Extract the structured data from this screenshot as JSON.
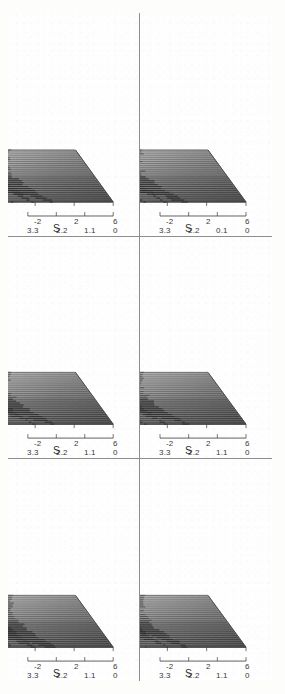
{
  "figure": {
    "caption_tags": [
      "(a)",
      "(b)",
      "(c)",
      "(d)",
      "(e)",
      "(f)"
    ],
    "orientation": "rotated-90-ccw",
    "panel_count": 6,
    "frame_color": "#8d8d8d",
    "ink_color": "#303030",
    "paper_color": "#fdfdfc"
  },
  "axes": {
    "p_name": "P",
    "s_name": "S",
    "x_name": "X",
    "p_ticks": [
      "3.3",
      "2.2",
      "1.1",
      "0"
    ],
    "p_ticks_alt": [
      "3.3",
      "2.2",
      "0.1",
      "0"
    ],
    "s_ticks": [
      "6",
      "2",
      "-2",
      "-6"
    ],
    "x_ticks": [
      "0.9",
      "0.3",
      "-0.3",
      "-0.9"
    ],
    "origin_tick": "6"
  },
  "chart_data": {
    "type": "line",
    "title": "",
    "subtitle": "",
    "xlabel": "S",
    "ylabel": "P",
    "zlabel": "X",
    "grid": false,
    "legend": "none",
    "projection": "3d-waterfall-mesh",
    "xlim": [
      -6,
      6
    ],
    "ylim": [
      0,
      3.3
    ],
    "zlim": [
      -0.9,
      0.9
    ],
    "x": [
      -6,
      -5.5,
      -5,
      -4.5,
      -4,
      -3.5,
      -3,
      -2.5,
      -2,
      -1.5,
      -1,
      -0.5,
      0,
      0.5,
      1,
      1.5,
      2,
      2.5,
      3,
      3.5,
      4,
      4.5,
      5,
      5.5,
      6
    ],
    "traces_per_panel": 28,
    "panels": [
      {
        "tag": "(a)",
        "row": 1,
        "col": 1,
        "p_ticks": [
          "3.3",
          "2.2",
          "1.1",
          "0"
        ],
        "peak_max": 3.3,
        "peak_positions": [
          -1.6,
          -0.4,
          0.9,
          2.3,
          3.6
        ],
        "series": [
          {
            "name": "X=0.9",
            "values": [
              0.02,
              0.04,
              0.07,
              0.12,
              0.22,
              0.45,
              0.9,
              1.6,
              2.4,
              1.4,
              0.7,
              0.5,
              0.85,
              1.5,
              0.9,
              0.45,
              0.3,
              0.55,
              1.1,
              0.6,
              0.3,
              0.18,
              0.1,
              0.05,
              0.02
            ]
          },
          {
            "name": "X=0.3",
            "values": [
              0.03,
              0.05,
              0.09,
              0.16,
              0.3,
              0.62,
              1.25,
              2.2,
              3.3,
              1.9,
              0.95,
              0.62,
              1.1,
              1.95,
              1.15,
              0.6,
              0.4,
              0.72,
              1.4,
              0.78,
              0.4,
              0.22,
              0.12,
              0.06,
              0.02
            ]
          },
          {
            "name": "X=-0.3",
            "values": [
              0.02,
              0.04,
              0.08,
              0.14,
              0.26,
              0.52,
              1.05,
              1.85,
              2.7,
              1.6,
              0.8,
              0.55,
              0.95,
              1.7,
              1.0,
              0.5,
              0.34,
              0.62,
              1.2,
              0.66,
              0.34,
              0.2,
              0.11,
              0.05,
              0.02
            ]
          },
          {
            "name": "X=-0.9",
            "values": [
              0.01,
              0.03,
              0.05,
              0.09,
              0.17,
              0.34,
              0.7,
              1.2,
              1.8,
              1.05,
              0.55,
              0.38,
              0.65,
              1.15,
              0.68,
              0.35,
              0.23,
              0.42,
              0.82,
              0.45,
              0.23,
              0.13,
              0.07,
              0.03,
              0.01
            ]
          }
        ]
      },
      {
        "tag": "(b)",
        "row": 1,
        "col": 2,
        "p_ticks": [
          "3.3",
          "2.2",
          "1.1",
          "0"
        ],
        "peak_max": 2.8,
        "peak_positions": [
          -1.9,
          -0.6,
          0.7,
          2.1,
          3.4
        ],
        "series": [
          {
            "name": "X=0.9",
            "values": [
              0.02,
              0.04,
              0.08,
              0.14,
              0.26,
              0.5,
              0.95,
              1.5,
              2.1,
              1.5,
              0.85,
              0.6,
              0.95,
              1.45,
              1.0,
              0.55,
              0.38,
              0.6,
              1.05,
              0.65,
              0.35,
              0.2,
              0.11,
              0.05,
              0.02
            ]
          },
          {
            "name": "X=0.3",
            "values": [
              0.03,
              0.06,
              0.11,
              0.19,
              0.34,
              0.66,
              1.3,
              2.05,
              2.8,
              2.0,
              1.15,
              0.8,
              1.3,
              1.95,
              1.35,
              0.72,
              0.5,
              0.8,
              1.4,
              0.85,
              0.46,
              0.26,
              0.14,
              0.07,
              0.03
            ]
          },
          {
            "name": "X=-0.3",
            "values": [
              0.02,
              0.05,
              0.09,
              0.16,
              0.29,
              0.56,
              1.1,
              1.72,
              2.35,
              1.68,
              0.96,
              0.67,
              1.1,
              1.64,
              1.13,
              0.6,
              0.42,
              0.67,
              1.17,
              0.72,
              0.39,
              0.22,
              0.12,
              0.06,
              0.02
            ]
          },
          {
            "name": "X=-0.9",
            "values": [
              0.01,
              0.03,
              0.06,
              0.1,
              0.19,
              0.37,
              0.72,
              1.13,
              1.55,
              1.1,
              0.63,
              0.44,
              0.72,
              1.08,
              0.74,
              0.4,
              0.28,
              0.44,
              0.77,
              0.47,
              0.26,
              0.15,
              0.08,
              0.04,
              0.01
            ]
          }
        ]
      },
      {
        "tag": "(c)",
        "row": 1,
        "col": 3,
        "p_ticks": [
          "3.3",
          "2.2",
          "1.1",
          "0"
        ],
        "peak_max": 3.1,
        "peak_positions": [
          -2.0,
          -0.8,
          0.5,
          1.9,
          3.2
        ],
        "series": [
          {
            "name": "X=0.9",
            "values": [
              0.02,
              0.05,
              0.09,
              0.15,
              0.28,
              0.55,
              1.05,
              1.7,
              2.3,
              1.6,
              0.9,
              0.62,
              1.0,
              1.55,
              1.05,
              0.58,
              0.4,
              0.63,
              1.1,
              0.68,
              0.37,
              0.21,
              0.11,
              0.05,
              0.02
            ]
          },
          {
            "name": "X=0.3",
            "values": [
              0.03,
              0.07,
              0.12,
              0.21,
              0.38,
              0.73,
              1.42,
              2.3,
              3.1,
              2.15,
              1.2,
              0.83,
              1.35,
              2.08,
              1.42,
              0.78,
              0.54,
              0.85,
              1.48,
              0.91,
              0.49,
              0.28,
              0.15,
              0.07,
              0.03
            ]
          },
          {
            "name": "X=-0.3",
            "values": [
              0.03,
              0.06,
              0.1,
              0.18,
              0.32,
              0.62,
              1.2,
              1.94,
              2.6,
              1.8,
              1.0,
              0.7,
              1.13,
              1.75,
              1.19,
              0.65,
              0.45,
              0.71,
              1.24,
              0.76,
              0.41,
              0.23,
              0.13,
              0.06,
              0.02
            ]
          },
          {
            "name": "X=-0.9",
            "values": [
              0.02,
              0.04,
              0.07,
              0.12,
              0.21,
              0.41,
              0.79,
              1.28,
              1.72,
              1.19,
              0.66,
              0.46,
              0.75,
              1.15,
              0.79,
              0.43,
              0.3,
              0.47,
              0.82,
              0.5,
              0.27,
              0.15,
              0.08,
              0.04,
              0.01
            ]
          }
        ]
      },
      {
        "tag": "(d)",
        "row": 2,
        "col": 1,
        "p_ticks": [
          "3.3",
          "2.2",
          "1.1",
          "0"
        ],
        "peak_max": 2.5,
        "peak_positions": [
          -1.7,
          -0.5,
          0.8,
          2.2,
          3.5
        ],
        "series": [
          {
            "name": "X=0.9",
            "values": [
              0.02,
              0.04,
              0.07,
              0.13,
              0.24,
              0.47,
              0.9,
              1.42,
              1.9,
              1.35,
              0.78,
              0.55,
              0.88,
              1.33,
              0.92,
              0.5,
              0.35,
              0.56,
              0.97,
              0.6,
              0.32,
              0.18,
              0.1,
              0.05,
              0.02
            ]
          },
          {
            "name": "X=0.3",
            "values": [
              0.03,
              0.06,
              0.1,
              0.18,
              0.32,
              0.62,
              1.2,
              1.88,
              2.5,
              1.78,
              1.02,
              0.71,
              1.15,
              1.74,
              1.2,
              0.65,
              0.45,
              0.72,
              1.26,
              0.78,
              0.42,
              0.24,
              0.13,
              0.06,
              0.02
            ]
          },
          {
            "name": "X=-0.3",
            "values": [
              0.02,
              0.05,
              0.09,
              0.15,
              0.27,
              0.53,
              1.02,
              1.6,
              2.12,
              1.51,
              0.87,
              0.6,
              0.98,
              1.48,
              1.02,
              0.55,
              0.38,
              0.61,
              1.07,
              0.66,
              0.36,
              0.2,
              0.11,
              0.05,
              0.02
            ]
          },
          {
            "name": "X=-0.9",
            "values": [
              0.01,
              0.03,
              0.06,
              0.1,
              0.18,
              0.35,
              0.67,
              1.05,
              1.4,
              1.0,
              0.57,
              0.4,
              0.65,
              0.98,
              0.67,
              0.36,
              0.25,
              0.4,
              0.7,
              0.43,
              0.23,
              0.13,
              0.07,
              0.03,
              0.01
            ]
          }
        ]
      },
      {
        "tag": "(e)",
        "row": 2,
        "col": 2,
        "p_ticks": [
          "3.3",
          "2.2",
          "1.1",
          "0"
        ],
        "peak_max": 2.6,
        "peak_positions": [
          -2.1,
          -0.7,
          0.6,
          2.0,
          3.3
        ],
        "series": [
          {
            "name": "X=0.9",
            "values": [
              0.02,
              0.04,
              0.08,
              0.14,
              0.25,
              0.49,
              0.94,
              1.48,
              1.98,
              1.4,
              0.8,
              0.56,
              0.91,
              1.38,
              0.95,
              0.52,
              0.36,
              0.58,
              1.0,
              0.62,
              0.33,
              0.19,
              0.1,
              0.05,
              0.02
            ]
          },
          {
            "name": "X=0.3",
            "values": [
              0.03,
              0.06,
              0.11,
              0.19,
              0.34,
              0.65,
              1.26,
              1.97,
              2.6,
              1.85,
              1.06,
              0.74,
              1.2,
              1.81,
              1.25,
              0.68,
              0.47,
              0.75,
              1.31,
              0.81,
              0.44,
              0.25,
              0.13,
              0.06,
              0.03
            ]
          },
          {
            "name": "X=-0.3",
            "values": [
              0.02,
              0.05,
              0.09,
              0.16,
              0.29,
              0.55,
              1.07,
              1.67,
              2.2,
              1.57,
              0.9,
              0.63,
              1.02,
              1.54,
              1.06,
              0.58,
              0.4,
              0.64,
              1.11,
              0.69,
              0.37,
              0.21,
              0.11,
              0.05,
              0.02
            ]
          },
          {
            "name": "X=-0.9",
            "values": [
              0.01,
              0.03,
              0.06,
              0.1,
              0.19,
              0.36,
              0.7,
              1.1,
              1.45,
              1.03,
              0.59,
              0.41,
              0.67,
              1.01,
              0.7,
              0.38,
              0.26,
              0.42,
              0.73,
              0.45,
              0.24,
              0.14,
              0.07,
              0.03,
              0.01
            ]
          }
        ]
      },
      {
        "tag": "(f)",
        "row": 2,
        "col": 3,
        "p_ticks": [
          "3.3",
          "2.2",
          "0.1",
          "0"
        ],
        "peak_max": 2.9,
        "peak_positions": [
          -2.2,
          -0.9,
          0.4,
          1.8,
          3.1
        ],
        "series": [
          {
            "name": "X=0.9",
            "values": [
              0.02,
              0.05,
              0.09,
              0.15,
              0.27,
              0.53,
              1.0,
              1.6,
              2.15,
              1.52,
              0.87,
              0.6,
              0.97,
              1.47,
              1.01,
              0.55,
              0.38,
              0.61,
              1.06,
              0.65,
              0.35,
              0.2,
              0.11,
              0.05,
              0.02
            ]
          },
          {
            "name": "X=0.3",
            "values": [
              0.03,
              0.06,
              0.12,
              0.2,
              0.36,
              0.7,
              1.35,
              2.15,
              2.9,
              2.05,
              1.15,
              0.8,
              1.29,
              1.96,
              1.35,
              0.74,
              0.51,
              0.81,
              1.41,
              0.87,
              0.47,
              0.27,
              0.14,
              0.07,
              0.03
            ]
          },
          {
            "name": "X=-0.3",
            "values": [
              0.03,
              0.05,
              0.1,
              0.17,
              0.3,
              0.59,
              1.14,
              1.81,
              2.44,
              1.72,
              0.97,
              0.67,
              1.09,
              1.65,
              1.13,
              0.62,
              0.43,
              0.68,
              1.18,
              0.73,
              0.39,
              0.22,
              0.12,
              0.06,
              0.02
            ]
          },
          {
            "name": "X=-0.9",
            "values": [
              0.02,
              0.04,
              0.07,
              0.11,
              0.2,
              0.39,
              0.75,
              1.2,
              1.61,
              1.14,
              0.64,
              0.44,
              0.72,
              1.09,
              0.75,
              0.41,
              0.28,
              0.45,
              0.78,
              0.48,
              0.26,
              0.15,
              0.08,
              0.04,
              0.01
            ]
          }
        ]
      }
    ]
  }
}
